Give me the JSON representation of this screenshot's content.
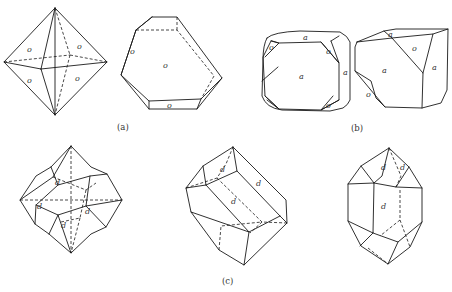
{
  "figure": {
    "panels": [
      {
        "id": "a",
        "caption": "(a)",
        "crystals": [
          {
            "name": "octahedron",
            "face_labels": [
              "o",
              "o",
              "o",
              "o"
            ]
          },
          {
            "name": "flattened-octahedron-plate",
            "face_labels": [
              "o",
              "o",
              "o"
            ]
          }
        ]
      },
      {
        "id": "b",
        "caption": "(b)",
        "crystals": [
          {
            "name": "cube-with-octahedron-truncation",
            "face_labels": [
              "a",
              "a",
              "a",
              "o",
              "o",
              "o",
              "o"
            ]
          },
          {
            "name": "distorted-cube-octahedron",
            "face_labels": [
              "a",
              "a",
              "a",
              "o",
              "o"
            ]
          }
        ]
      },
      {
        "id": "c",
        "caption": "(c)",
        "crystals": [
          {
            "name": "rhombic-dodecahedron",
            "face_labels": [
              "d",
              "d",
              "d",
              "d"
            ]
          },
          {
            "name": "elongated-dodecahedron-oblique",
            "face_labels": [
              "d",
              "d",
              "d"
            ]
          },
          {
            "name": "elongated-dodecahedron-vertical",
            "face_labels": [
              "d",
              "d",
              "d"
            ]
          }
        ]
      }
    ],
    "labels": {
      "o": "o",
      "a": "a",
      "d": "d"
    }
  }
}
